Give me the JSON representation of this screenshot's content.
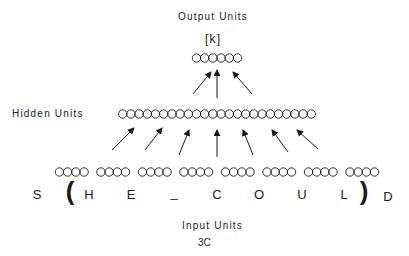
{
  "labels": {
    "output_units": "Output Units",
    "output_target": "[k]",
    "hidden_units": "Hidden Units",
    "input_units": "Input Units",
    "figure_id": "3C"
  },
  "network": {
    "output_unit_count": 6,
    "hidden_unit_count": 24,
    "input_group_count": 8,
    "units_per_input_group": 4,
    "output_arrow_count": 3,
    "hidden_arrow_count": 7
  },
  "input_text": {
    "context_left": "S",
    "open_bracket": "(",
    "window_chars": [
      "H",
      "E",
      "_",
      "C",
      "O",
      "U",
      "L"
    ],
    "close_bracket": ")",
    "context_right": "D"
  },
  "colors": {
    "ink": "#1a1a1a",
    "background": "#ffffff"
  }
}
